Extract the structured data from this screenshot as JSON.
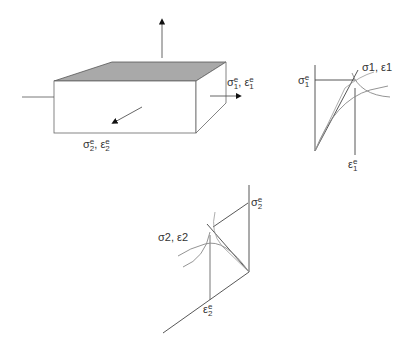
{
  "figure": {
    "box_labels": {
      "right": {
        "sym1": "σ",
        "sup1": "e",
        "sub1": "1",
        "sep": ",",
        "sym2": "ε",
        "sup2": "e",
        "sub2": "1"
      },
      "front": {
        "sym1": "σ",
        "sup1": "e",
        "sub1": "2",
        "sep": ",",
        "sym2": "ε",
        "sup2": "e",
        "sub2": "2"
      }
    },
    "chart1": {
      "curve_label": "σ1, ε1",
      "stress_tick": {
        "sym": "σ",
        "sup": "e",
        "sub": "1"
      },
      "strain_tick": {
        "sym": "ε",
        "sup": "e",
        "sub": "1"
      }
    },
    "chart2": {
      "curve_label": "σ2, ε2",
      "stress_tick": {
        "sym": "σ",
        "sup": "e",
        "sub": "2"
      },
      "strain_tick": {
        "sym": "ε",
        "sup": "e",
        "sub": "2"
      }
    },
    "colors": {
      "line": "#333333",
      "curve": "#888888",
      "top_face": "#a9a9a9"
    }
  }
}
